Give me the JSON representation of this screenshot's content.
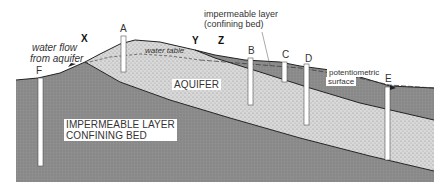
{
  "diagram": {
    "labels": {
      "point_x": "X",
      "point_y": "Y",
      "point_z": "Z",
      "water_flow_line1": "water flow",
      "water_flow_line2": "from aquifer",
      "water_table": "water table",
      "aquifer": "AQUIFER",
      "upper_confining_line1": "impermeable layer",
      "upper_confining_line2": "(confining bed)",
      "potentiometric_line1": "potentiometric",
      "potentiometric_line2": "surface",
      "lower_confining_line1": "IMPERMEABLE LAYER",
      "lower_confining_line2": "CONFINING BED"
    },
    "wells": [
      {
        "id": "F",
        "label": "F"
      },
      {
        "id": "A",
        "label": "A"
      },
      {
        "id": "B",
        "label": "B"
      },
      {
        "id": "C",
        "label": "C"
      },
      {
        "id": "D",
        "label": "D"
      },
      {
        "id": "E",
        "label": "E"
      }
    ],
    "colors": {
      "impermeable_layer": "#8a8a8a",
      "aquifer": "#d6d6d6",
      "outline": "#222222",
      "well": "#ffffff"
    }
  }
}
